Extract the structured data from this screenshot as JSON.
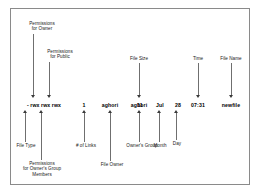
{
  "diagram": {
    "frame": {
      "border_color": "#8a8a8a",
      "background": "#ffffff"
    },
    "stem_color": "#6f6f6f",
    "arrow_color": "#3a3a3a",
    "data_line": {
      "raw": "- rwx rwx rwx   1   aghori  aghori   11  Jul  28  07:31   newfile",
      "tokens": [
        {
          "id": "permissions",
          "text": "- rwx rwx rwx"
        },
        {
          "id": "links",
          "text": "1"
        },
        {
          "id": "owner",
          "text": "aghori"
        },
        {
          "id": "group",
          "text": "aghori"
        },
        {
          "id": "size",
          "text": "11"
        },
        {
          "id": "month",
          "text": "Jul"
        },
        {
          "id": "day",
          "text": "28"
        },
        {
          "id": "time",
          "text": "07:31"
        },
        {
          "id": "filename",
          "text": "newfile"
        }
      ]
    },
    "labels_above": [
      {
        "id": "permissions-owner",
        "text": "Permissions\nfor Owner"
      },
      {
        "id": "permissions-public",
        "text": "Permissions\nfor Public"
      },
      {
        "id": "file-size",
        "text": "File Size"
      },
      {
        "id": "time",
        "text": "Time"
      },
      {
        "id": "file-name",
        "text": "File Name"
      }
    ],
    "labels_below": [
      {
        "id": "file-type",
        "text": "File Type"
      },
      {
        "id": "permissions-group",
        "text": "Permissions\nfor Owner's Group\nMembers"
      },
      {
        "id": "number-of-links",
        "text": "# of Links"
      },
      {
        "id": "file-owner",
        "text": "File Owner"
      },
      {
        "id": "owners-group",
        "text": "Owner's Group"
      },
      {
        "id": "month",
        "text": "Month"
      },
      {
        "id": "day",
        "text": "Day"
      }
    ]
  }
}
